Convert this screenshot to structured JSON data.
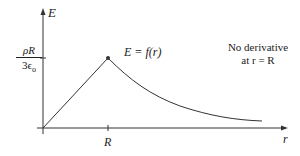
{
  "diagram": {
    "y_axis_label": "E",
    "x_axis_label": "r",
    "x_tick_label": "R",
    "y_tick_label": {
      "numerator": "ρR",
      "denominator": "3ϵ",
      "denominator_subscript": "o"
    },
    "curve_label": "E = f(r)",
    "annotation_line1": "No derivative",
    "annotation_line2": "at r = R",
    "colors": {
      "line": "#333333",
      "text": "#222222",
      "background": "#ffffff"
    }
  }
}
